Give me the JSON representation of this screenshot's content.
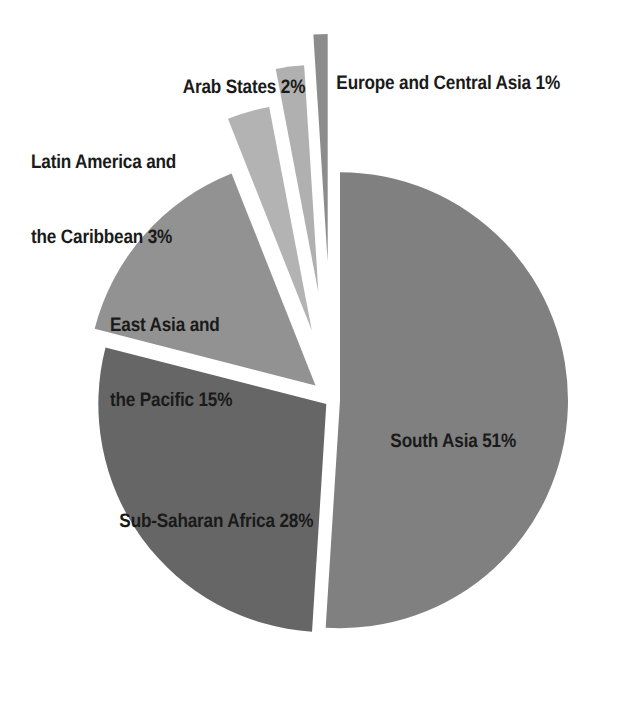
{
  "chart_data": {
    "type": "pie",
    "title": "",
    "subtitle": "",
    "xlabel": "",
    "ylabel": "",
    "legend_position": "none",
    "grid": false,
    "units": "percent",
    "total": 100,
    "categories": [
      "South Asia",
      "Sub-Saharan Africa",
      "East Asia and the Pacific",
      "Latin America and the Caribbean",
      "Arab States",
      "Europe and Central Asia"
    ],
    "values": [
      51,
      28,
      15,
      3,
      2,
      1
    ],
    "slices": [
      {
        "name": "South Asia",
        "label": "South Asia 51%",
        "label_lines": [
          "South Asia 51%"
        ],
        "value": 51,
        "color": "#808080",
        "start_angle": 0.0,
        "end_angle": 183.6,
        "exploded": true,
        "explode_offset": 8
      },
      {
        "name": "Sub-Saharan Africa",
        "label": "Sub-Saharan Africa 28%",
        "label_lines": [
          "Sub-Saharan Africa 28%"
        ],
        "value": 28,
        "color": "#666666",
        "start_angle": 183.6,
        "end_angle": 284.4,
        "exploded": true,
        "explode_offset": 7
      },
      {
        "name": "East Asia and the Pacific",
        "label": "East Asia and the Pacific 15%",
        "label_lines": [
          "East Asia and",
          "the Pacific 15%"
        ],
        "value": 15,
        "color": "#929292",
        "start_angle": 284.4,
        "end_angle": 338.4,
        "exploded": true,
        "explode_offset": 22
      },
      {
        "name": "Latin America and the Caribbean",
        "label": "Latin America and the Caribbean 3%",
        "label_lines": [
          "Latin America and",
          "the Caribbean 3%"
        ],
        "value": 3,
        "color": "#b3b3b3",
        "start_angle": 338.4,
        "end_angle": 349.2,
        "exploded": true,
        "explode_offset": 72
      },
      {
        "name": "Arab States",
        "label": "Arab States 2%",
        "label_lines": [
          "Arab States 2%"
        ],
        "value": 2,
        "color": "#b0b0b0",
        "start_angle": 349.2,
        "end_angle": 356.4,
        "exploded": true,
        "explode_offset": 108
      },
      {
        "name": "Europe and Central Asia",
        "label": "Europe and Central Asia 1%",
        "label_lines": [
          "Europe and Central Asia 1%"
        ],
        "value": 1,
        "color": "#8c8c8c",
        "start_angle": 356.4,
        "end_angle": 360.0,
        "exploded": true,
        "explode_offset": 138
      }
    ],
    "geometry": {
      "center_x": 332,
      "center_y": 400,
      "radius": 228
    },
    "colors": {
      "south_asia": "#808080",
      "sub_saharan_africa": "#666666",
      "east_asia_pacific": "#929292",
      "latin_america_caribbean": "#b3b3b3",
      "arab_states": "#b0b0b0",
      "europe_central_asia": "#8c8c8c",
      "background": "#ffffff",
      "label_text": "#1a1a1a"
    }
  },
  "labels": {
    "europe": "Europe and Central Asia 1%",
    "arab": "Arab States 2%",
    "latin_line1": "Latin America and",
    "latin_line2": "the Caribbean 3%",
    "eastasia_line1": "East Asia and",
    "eastasia_line2": "the Pacific 15%",
    "southasia": "South Asia 51%",
    "subsaharan": "Sub-Saharan Africa 28%"
  }
}
